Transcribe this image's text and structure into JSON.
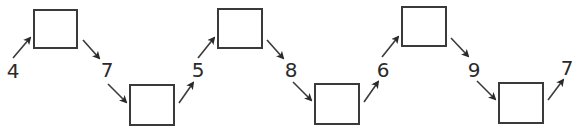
{
  "diagram": {
    "type": "number-chain",
    "colors": {
      "stroke": "#3a3a3a",
      "text": "#2a2a2a",
      "background": "#ffffff"
    },
    "labels": [
      {
        "text": "4",
        "x": 5,
        "y": 61
      },
      {
        "text": "7",
        "x": 99,
        "y": 60
      },
      {
        "text": "5",
        "x": 190,
        "y": 60
      },
      {
        "text": "8",
        "x": 283,
        "y": 60
      },
      {
        "text": "6",
        "x": 375,
        "y": 60
      },
      {
        "text": "9",
        "x": 466,
        "y": 60
      },
      {
        "text": "7",
        "x": 559,
        "y": 58
      }
    ],
    "boxes": [
      {
        "id": "box-1",
        "x": 33,
        "y": 9,
        "w": 45,
        "h": 40,
        "value": ""
      },
      {
        "id": "box-2",
        "x": 129,
        "y": 84,
        "w": 46,
        "h": 42,
        "value": ""
      },
      {
        "id": "box-3",
        "x": 217,
        "y": 8,
        "w": 46,
        "h": 41,
        "value": ""
      },
      {
        "id": "box-4",
        "x": 314,
        "y": 83,
        "w": 46,
        "h": 42,
        "value": ""
      },
      {
        "id": "box-5",
        "x": 401,
        "y": 6,
        "w": 46,
        "h": 41,
        "value": ""
      },
      {
        "id": "box-6",
        "x": 498,
        "y": 82,
        "w": 46,
        "h": 42,
        "value": ""
      }
    ],
    "arrows": [
      {
        "from": [
          13,
          58
        ],
        "to": [
          30,
          38
        ]
      },
      {
        "from": [
          83,
          40
        ],
        "to": [
          99,
          58
        ]
      },
      {
        "from": [
          108,
          84
        ],
        "to": [
          126,
          102
        ]
      },
      {
        "from": [
          179,
          103
        ],
        "to": [
          193,
          83
        ]
      },
      {
        "from": [
          198,
          58
        ],
        "to": [
          214,
          38
        ]
      },
      {
        "from": [
          267,
          40
        ],
        "to": [
          283,
          58
        ]
      },
      {
        "from": [
          293,
          82
        ],
        "to": [
          311,
          100
        ]
      },
      {
        "from": [
          364,
          102
        ],
        "to": [
          378,
          82
        ]
      },
      {
        "from": [
          382,
          57
        ],
        "to": [
          398,
          37
        ]
      },
      {
        "from": [
          451,
          38
        ],
        "to": [
          468,
          56
        ]
      },
      {
        "from": [
          477,
          81
        ],
        "to": [
          495,
          99
        ]
      },
      {
        "from": [
          548,
          100
        ],
        "to": [
          563,
          80
        ]
      }
    ]
  }
}
